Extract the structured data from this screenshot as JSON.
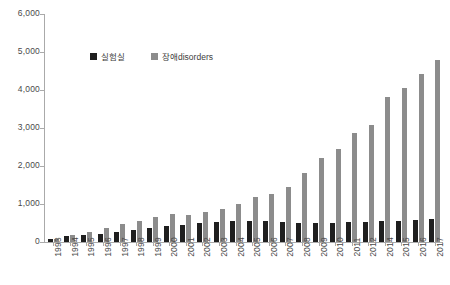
{
  "chart_data": {
    "type": "bar",
    "title": "",
    "xlabel": "",
    "ylabel": "",
    "ylim": [
      0,
      6000
    ],
    "ytick_labels": [
      "6,000",
      "5,000",
      "4,000",
      "3,000",
      "2,000",
      "1,000",
      "0"
    ],
    "ytick_values": [
      6000,
      5000,
      4000,
      3000,
      2000,
      1000,
      0
    ],
    "grid": false,
    "legend_position": "inside-top-left",
    "categories": [
      "1993",
      "1994",
      "1995",
      "1996",
      "1997",
      "1998",
      "1999",
      "2000",
      "2001",
      "2002",
      "2003",
      "2004",
      "2005",
      "2006",
      "2007",
      "2008",
      "2009",
      "2010",
      "2011",
      "2012",
      "2014",
      "2015",
      "2016",
      "2017"
    ],
    "series": [
      {
        "name": "실험실",
        "color": "#1f1f1f",
        "values": [
          80,
          150,
          175,
          200,
          255,
          310,
          380,
          425,
          455,
          505,
          535,
          540,
          545,
          540,
          535,
          500,
          495,
          490,
          515,
          530,
          560,
          565,
          575,
          615
        ]
      },
      {
        "name": "장애disorders",
        "color": "#8c8c8c",
        "values": [
          70,
          185,
          255,
          360,
          470,
          565,
          660,
          725,
          700,
          790,
          870,
          1010,
          1175,
          1270,
          1440,
          1825,
          2210,
          2435,
          2865,
          3090,
          3825,
          4055,
          4425,
          4790
        ]
      }
    ]
  },
  "legend": {
    "items": [
      {
        "label": "실험실",
        "swatch": "black-square-icon"
      },
      {
        "label": "장애disorders",
        "swatch": "gray-square-icon"
      }
    ]
  }
}
